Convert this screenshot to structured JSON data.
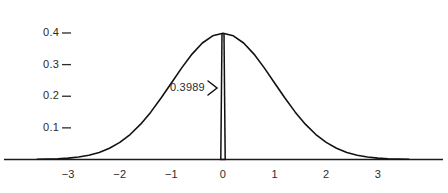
{
  "chart_data": {
    "type": "line",
    "title": "",
    "subtitle": "",
    "xlabel": "",
    "ylabel": "",
    "function": "standard normal probability density",
    "formula": "phi(x) = (1/sqrt(2*pi)) * exp(-x^2/2)",
    "xlim": [
      -3.6,
      3.6
    ],
    "ylim": [
      0,
      0.44
    ],
    "grid": false,
    "legend": null,
    "x_ticks": [
      -3,
      -2,
      -1,
      0,
      1,
      2,
      3
    ],
    "x_tick_labels": [
      "−3",
      "−2",
      "−1",
      "0",
      "1",
      "2",
      "3"
    ],
    "y_ticks": [
      0.1,
      0.2,
      0.3,
      0.4
    ],
    "y_tick_labels": [
      "0.1",
      "0.2",
      "0.3",
      "0.4"
    ],
    "series": [
      {
        "name": "normal-density-curve",
        "x": [
          -3.6,
          -3.4,
          -3.2,
          -3.0,
          -2.8,
          -2.6,
          -2.4,
          -2.2,
          -2.0,
          -1.8,
          -1.6,
          -1.4,
          -1.2,
          -1.0,
          -0.8,
          -0.6,
          -0.4,
          -0.2,
          0.0,
          0.2,
          0.4,
          0.6,
          0.8,
          1.0,
          1.2,
          1.4,
          1.6,
          1.8,
          2.0,
          2.2,
          2.4,
          2.6,
          2.8,
          3.0,
          3.2,
          3.4,
          3.6
        ],
        "values": [
          0.0006,
          0.0012,
          0.0024,
          0.0044,
          0.0079,
          0.0136,
          0.0224,
          0.0355,
          0.054,
          0.079,
          0.1109,
          0.1497,
          0.1942,
          0.242,
          0.2897,
          0.3332,
          0.3683,
          0.391,
          0.3989,
          0.391,
          0.3683,
          0.3332,
          0.2897,
          0.242,
          0.1942,
          0.1497,
          0.1109,
          0.079,
          0.054,
          0.0355,
          0.0224,
          0.0136,
          0.0079,
          0.0044,
          0.0024,
          0.0012,
          0.0006
        ]
      }
    ],
    "annotations": [
      {
        "name": "peak-value-callout",
        "label": "0.3989",
        "x": 0,
        "y": 0.3989,
        "marker": "vertical-segment-at-zero",
        "pointer": "right-arrowhead"
      }
    ]
  },
  "axes": {
    "x_axis_name": "horizontal-axis-line",
    "y_axis_tick_mark": "–"
  },
  "style": {
    "background": "#ffffff",
    "curve_color": "#111111",
    "axis_color": "#1a1a1a",
    "text_color": "#2b2b2b"
  }
}
